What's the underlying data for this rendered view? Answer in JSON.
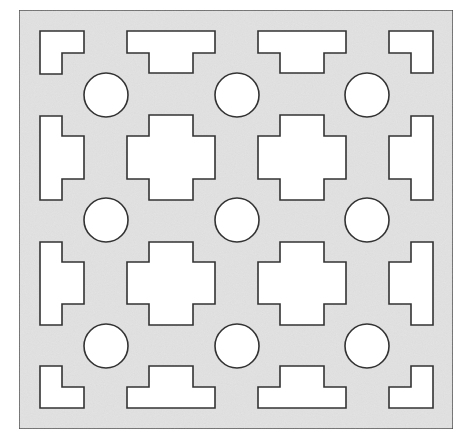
{
  "diagram": {
    "type": "perforated-panel-pattern",
    "colors": {
      "background": "#ffffff",
      "panel_fill": "#e2e2e2",
      "panel_stroke": "#444444",
      "hole_fill": "#ffffff",
      "hole_stroke": "#333333"
    },
    "panel": {
      "x": 19,
      "y": 10,
      "width": 434,
      "height": 419
    },
    "circles": [
      {
        "cx": 106,
        "cy": 95,
        "r": 22
      },
      {
        "cx": 237,
        "cy": 95,
        "r": 22
      },
      {
        "cx": 367,
        "cy": 95,
        "r": 22
      },
      {
        "cx": 106,
        "cy": 220,
        "r": 22
      },
      {
        "cx": 237,
        "cy": 220,
        "r": 22
      },
      {
        "cx": 367,
        "cy": 220,
        "r": 22
      },
      {
        "cx": 106,
        "cy": 346,
        "r": 22
      },
      {
        "cx": 237,
        "cy": 346,
        "r": 22
      },
      {
        "cx": 367,
        "cy": 346,
        "r": 22
      }
    ],
    "shapes": [
      {
        "name": "corner-l-top-left",
        "points": "40,31 84,31 84,53 62,53 62,74 40,74"
      },
      {
        "name": "t-top-1",
        "points": "127,31 215,31 215,53 193,53 193,73 149,73 149,53 127,53"
      },
      {
        "name": "t-top-2",
        "points": "258,31 346,31 346,53 324,53 324,73 280,73 280,53 258,53"
      },
      {
        "name": "corner-l-top-right",
        "points": "389,31 433,31 433,73 411,73 411,53 389,53"
      },
      {
        "name": "side-left-1",
        "points": "40,116 62,116 62,136 84,136 84,179 62,179 62,200 40,200"
      },
      {
        "name": "cross-1",
        "points": "149,115 193,115 193,136 215,136 215,179 193,179 193,200 149,200 149,179 127,179 127,136 149,136"
      },
      {
        "name": "cross-2",
        "points": "280,115 324,115 324,136 346,136 346,179 324,179 324,200 280,200 280,179 258,179 258,136 280,136"
      },
      {
        "name": "side-right-1",
        "points": "411,116 433,116 433,200 411,200 411,179 389,179 389,136 411,136"
      },
      {
        "name": "side-left-2",
        "points": "40,242 62,242 62,262 84,262 84,304 62,304 62,325 40,325"
      },
      {
        "name": "cross-3",
        "points": "149,242 193,242 193,262 215,262 215,304 193,304 193,325 149,325 149,304 127,304 127,262 149,262"
      },
      {
        "name": "cross-4",
        "points": "280,242 324,242 324,262 346,262 346,304 324,304 324,325 280,325 280,304 258,304 258,262 280,262"
      },
      {
        "name": "side-right-2",
        "points": "411,242 433,242 433,325 411,325 411,304 389,304 389,262 411,262"
      },
      {
        "name": "corner-l-bottom-left",
        "points": "40,366 62,366 62,387 84,387 84,408 40,408"
      },
      {
        "name": "t-bottom-1",
        "points": "149,366 193,366 193,387 215,387 215,408 127,408 127,387 149,387"
      },
      {
        "name": "t-bottom-2",
        "points": "280,366 324,366 324,387 346,387 346,408 258,408 258,387 280,387"
      },
      {
        "name": "corner-l-bottom-right",
        "points": "411,366 433,366 433,408 389,408 389,387 411,387"
      }
    ]
  }
}
